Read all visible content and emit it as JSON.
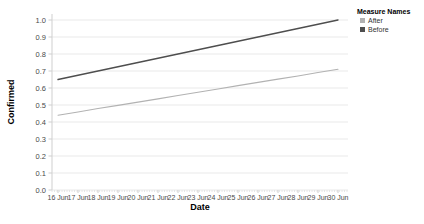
{
  "chart_data": {
    "type": "line",
    "title": "",
    "xlabel": "Date",
    "ylabel": "Confirmed",
    "x": [
      "16 Jun",
      "17 Jun",
      "18 Jun",
      "19 Jun",
      "20 Jun",
      "21 Jun",
      "22 Jun",
      "23 Jun",
      "24 Jun",
      "25 Jun",
      "26 Jun",
      "27 Jun",
      "28 Jun",
      "29 Jun",
      "30 Jun"
    ],
    "series": [
      {
        "name": "After",
        "color": "#b2b2b2",
        "values": [
          0.44,
          0.459,
          0.479,
          0.498,
          0.517,
          0.536,
          0.556,
          0.575,
          0.594,
          0.614,
          0.633,
          0.652,
          0.671,
          0.691,
          0.71
        ]
      },
      {
        "name": "Before",
        "color": "#4e4e4e",
        "values": [
          0.65,
          0.675,
          0.7,
          0.725,
          0.75,
          0.775,
          0.8,
          0.825,
          0.85,
          0.875,
          0.9,
          0.925,
          0.95,
          0.975,
          1.0
        ]
      }
    ],
    "ylim": [
      0.0,
      1.0
    ],
    "yticks": [
      "0.0",
      "0.1",
      "0.2",
      "0.3",
      "0.4",
      "0.5",
      "0.6",
      "0.7",
      "0.8",
      "0.9",
      "1.0"
    ],
    "grid": "horizontal",
    "legend": {
      "title": "Measure Names",
      "position": "top-right",
      "items": [
        "After",
        "Before"
      ]
    },
    "style": {
      "grid_color": "#e9e9e9",
      "axis_color": "#cfcfcf",
      "minor_tick_color": "#e2e2e2",
      "tick_label_color": "#4a4a4a"
    }
  }
}
